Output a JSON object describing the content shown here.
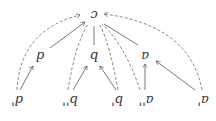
{
  "diagram": {
    "orientation": "rotated-180",
    "root": {
      "label": "c"
    },
    "middle": [
      {
        "label": "d"
      },
      {
        "label": "b"
      },
      {
        "label": "a"
      }
    ],
    "leaves": [
      {
        "label": "d'"
      },
      {
        "label": "b''"
      },
      {
        "label": "b'"
      },
      {
        "label": "a''"
      },
      {
        "label": "a'"
      }
    ],
    "edges_solid": [
      "d->c",
      "b->c",
      "a->c",
      "d'->d",
      "b''->b",
      "b'->b",
      "a''->a",
      "a'->a"
    ],
    "edges_dashed": [
      "d'->c",
      "b''->c",
      "b'->c",
      "a''->c",
      "a'->c"
    ]
  }
}
